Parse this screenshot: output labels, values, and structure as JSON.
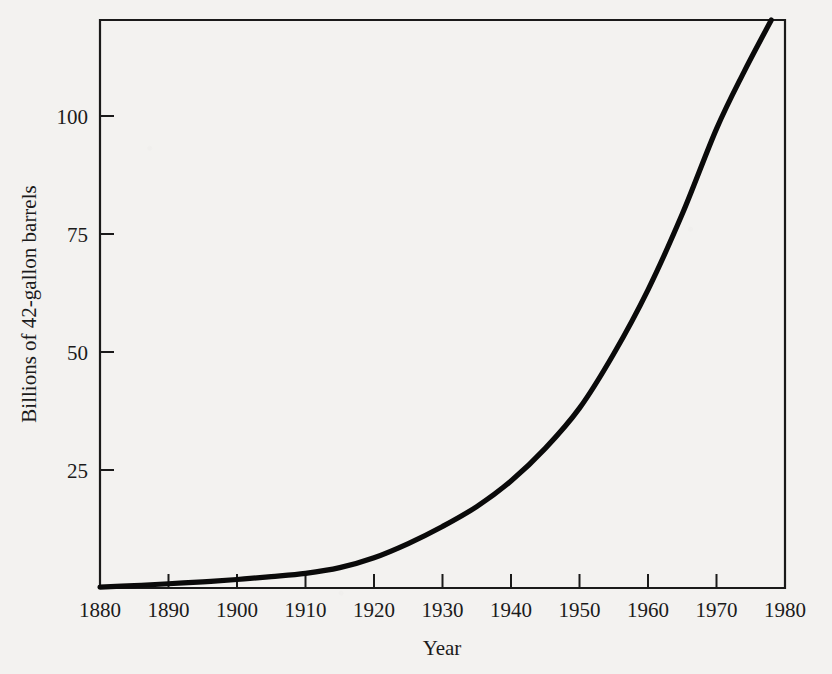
{
  "chart_data": {
    "type": "line",
    "title": "",
    "subtitle": "",
    "xlabel": "Year",
    "ylabel": "Billions of 42-gallon barrels",
    "xlim": [
      1880,
      1980
    ],
    "ylim": [
      0,
      120
    ],
    "grid": false,
    "legend": false,
    "legend_position": "none",
    "x_ticks": [
      1880,
      1890,
      1900,
      1910,
      1920,
      1930,
      1940,
      1950,
      1960,
      1970,
      1980
    ],
    "x_tick_labels": [
      "1880",
      "1890",
      "1900",
      "1910",
      "1920",
      "1930",
      "1940",
      "1950",
      "1960",
      "1970",
      "1980"
    ],
    "y_ticks": [
      25,
      50,
      75,
      100
    ],
    "y_tick_labels": [
      "25",
      "50",
      "75",
      "100"
    ],
    "series": [
      {
        "name": "Cumulative world crude oil production",
        "color": "#0a0a0a",
        "x": [
          1880,
          1885,
          1890,
          1895,
          1900,
          1905,
          1910,
          1915,
          1920,
          1925,
          1930,
          1935,
          1940,
          1945,
          1950,
          1955,
          1960,
          1965,
          1970,
          1974,
          1978
        ],
        "values": [
          0.2,
          0.5,
          0.9,
          1.3,
          1.8,
          2.4,
          3.1,
          4.3,
          6.4,
          9.4,
          13.0,
          17.2,
          22.6,
          29.5,
          38.0,
          49.5,
          63.0,
          79.0,
          97.0,
          109.0,
          120.0
        ]
      }
    ],
    "annotations": []
  },
  "figure": {
    "background_color": "#f3f2f0",
    "ink_color": "#1a1a1a",
    "axes": {
      "frame": "closed-box",
      "tick_direction": "inward"
    }
  }
}
